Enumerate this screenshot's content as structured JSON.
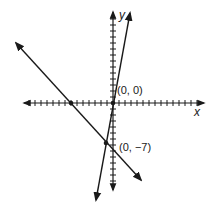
{
  "chart_data": {
    "type": "line",
    "title": "",
    "xlabel": "x",
    "ylabel": "y",
    "xlim": [
      -15,
      15
    ],
    "ylim": [
      -15,
      15
    ],
    "grid": false,
    "tick_spacing": 1,
    "series": [
      {
        "name": "line through origin",
        "equation": "y = 6x",
        "points": [
          [
            -2.5,
            -15
          ],
          [
            2.5,
            15
          ]
        ]
      },
      {
        "name": "line through (0, -7)",
        "equation": "y = -x - 7",
        "points": [
          [
            -17,
            10
          ],
          [
            4,
            -11
          ]
        ]
      }
    ],
    "marked_points": [
      {
        "x": 0,
        "y": 0,
        "label": "(0, 0)"
      },
      {
        "x": 0,
        "y": -7,
        "label": "(0, −7)"
      },
      {
        "x": -7,
        "y": 0,
        "label": ""
      },
      {
        "x": -1,
        "y": -6,
        "label": ""
      }
    ],
    "annotations": [
      "(0, 0)",
      "(0, −7)"
    ]
  },
  "labels": {
    "x_axis": "x",
    "y_axis": "y",
    "origin": "(0, 0)",
    "y_intercept": "(0, −7)"
  }
}
